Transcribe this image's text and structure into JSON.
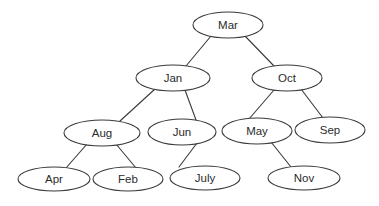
{
  "diagram": {
    "type": "tree",
    "title": "",
    "background_color": "#ffffff",
    "node_fill_color": "#ffffff",
    "node_stroke_color": "#3a3a3a",
    "edge_color": "#3a3a3a",
    "text_color": "#2b2b2b",
    "node_shape": "ellipse",
    "root": "Mar",
    "levels": 4,
    "nodes": [
      {
        "id": "mar",
        "label": "Mar",
        "cx": 228,
        "cy": 25,
        "rx": 35,
        "ry": 13,
        "level": 0
      },
      {
        "id": "jan",
        "label": "Jan",
        "cx": 173,
        "cy": 78,
        "rx": 37,
        "ry": 13,
        "level": 1
      },
      {
        "id": "oct",
        "label": "Oct",
        "cx": 287,
        "cy": 78,
        "rx": 35,
        "ry": 13,
        "level": 1
      },
      {
        "id": "aug",
        "label": "Aug",
        "cx": 102,
        "cy": 133,
        "rx": 38,
        "ry": 13,
        "level": 2
      },
      {
        "id": "jun",
        "label": "Jun",
        "cx": 182,
        "cy": 132,
        "rx": 34,
        "ry": 13,
        "level": 2
      },
      {
        "id": "may",
        "label": "May",
        "cx": 257,
        "cy": 131,
        "rx": 35,
        "ry": 13,
        "level": 2
      },
      {
        "id": "sep",
        "label": "Sep",
        "cx": 330,
        "cy": 130,
        "rx": 35,
        "ry": 13,
        "level": 2
      },
      {
        "id": "apr",
        "label": "Apr",
        "cx": 54,
        "cy": 179,
        "rx": 36,
        "ry": 12,
        "level": 3
      },
      {
        "id": "feb",
        "label": "Feb",
        "cx": 128,
        "cy": 179,
        "rx": 35,
        "ry": 12,
        "level": 3
      },
      {
        "id": "july",
        "label": "July",
        "cx": 205,
        "cy": 178,
        "rx": 35,
        "ry": 12,
        "level": 3
      },
      {
        "id": "nov",
        "label": "Nov",
        "cx": 304,
        "cy": 178,
        "rx": 36,
        "ry": 12,
        "level": 3
      }
    ],
    "edges": [
      {
        "from": "mar",
        "to": "jan",
        "x1": 211,
        "y1": 36,
        "x2": 186,
        "y2": 66
      },
      {
        "from": "mar",
        "to": "oct",
        "x1": 245,
        "y1": 36,
        "x2": 274,
        "y2": 66
      },
      {
        "from": "jan",
        "to": "aug",
        "x1": 155,
        "y1": 89,
        "x2": 120,
        "y2": 121
      },
      {
        "from": "jan",
        "to": "jun",
        "x1": 185,
        "y1": 90,
        "x2": 196,
        "y2": 120
      },
      {
        "from": "oct",
        "to": "may",
        "x1": 274,
        "y1": 90,
        "x2": 249,
        "y2": 119
      },
      {
        "from": "oct",
        "to": "sep",
        "x1": 301,
        "y1": 89,
        "x2": 323,
        "y2": 118
      },
      {
        "from": "aug",
        "to": "apr",
        "x1": 87,
        "y1": 144,
        "x2": 66,
        "y2": 168
      },
      {
        "from": "aug",
        "to": "feb",
        "x1": 116,
        "y1": 144,
        "x2": 136,
        "y2": 168
      },
      {
        "from": "jun",
        "to": "july",
        "x1": 197,
        "y1": 143,
        "x2": 179,
        "y2": 167
      },
      {
        "from": "may",
        "to": "nov",
        "x1": 271,
        "y1": 142,
        "x2": 291,
        "y2": 167
      }
    ]
  }
}
